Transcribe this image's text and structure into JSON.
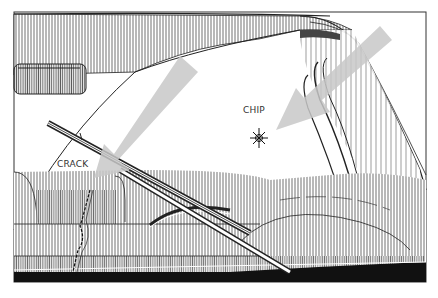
{
  "diagram": {
    "labels": {
      "chip": "CHIP",
      "crack": "CRACK"
    },
    "arrows": [
      {
        "name": "crack-arrow",
        "direction": "down-left",
        "color": "#c8c8c8"
      },
      {
        "name": "chip-arrow",
        "direction": "down-left",
        "color": "#c8c8c8"
      }
    ],
    "colors": {
      "line": "#222222",
      "arrow": "#c8c8c8",
      "background": "#ffffff",
      "dash": "#111111"
    }
  }
}
